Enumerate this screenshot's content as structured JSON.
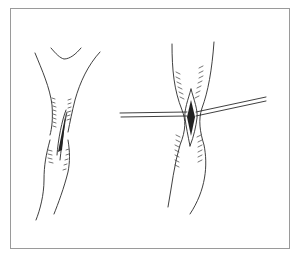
{
  "figure": {
    "panels": [
      {
        "id": "left",
        "content": "tubular vessel with flared top and longitudinal incision"
      },
      {
        "id": "right",
        "content": "tubular vessel with incision held open by a transverse rod/suture"
      }
    ],
    "colors": {
      "line": "#2a2a2a",
      "frame": "#9a9a9a",
      "background": "#ffffff"
    }
  }
}
